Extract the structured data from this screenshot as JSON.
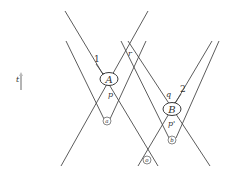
{
  "diagram": {
    "axis": {
      "label": "t",
      "x": 16,
      "y": 82,
      "arrow": {
        "x": 21,
        "y1": 90,
        "y2": 72
      }
    },
    "lines": [
      {
        "id": "worldline-left-outer-down",
        "x1": 65,
        "y1": 11,
        "x2": 158,
        "y2": 166
      },
      {
        "id": "worldline-left-outer-up",
        "x1": 148,
        "y1": 11,
        "x2": 61,
        "y2": 166
      },
      {
        "id": "cone-a-left",
        "x1": 66,
        "y1": 41,
        "x2": 104,
        "y2": 119
      },
      {
        "id": "cone-a-right",
        "x1": 110,
        "y1": 119,
        "x2": 146,
        "y2": 41
      },
      {
        "id": "cone-b-left",
        "x1": 121,
        "y1": 41,
        "x2": 169,
        "y2": 138
      },
      {
        "id": "worldline-right-down",
        "x1": 128,
        "y1": 41,
        "x2": 210,
        "y2": 166
      },
      {
        "id": "worldline-right-up",
        "x1": 212,
        "y1": 41,
        "x2": 138,
        "y2": 166
      },
      {
        "id": "cone-b-right",
        "x1": 176,
        "y1": 138,
        "x2": 219,
        "y2": 41
      }
    ],
    "events": [
      {
        "label": "A",
        "cx": 109,
        "cy": 79,
        "rx": 9,
        "ry": 6.5
      },
      {
        "label": "B",
        "cx": 172,
        "cy": 109,
        "rx": 9,
        "ry": 6.5
      }
    ],
    "vertices": [
      {
        "label": "a",
        "cx": 107,
        "cy": 121,
        "r": 4
      },
      {
        "label": "b",
        "cx": 172,
        "cy": 140,
        "r": 4
      },
      {
        "label": "o",
        "cx": 147,
        "cy": 160,
        "r": 4
      }
    ],
    "labels": [
      {
        "text": "1",
        "x": 94,
        "y": 62,
        "kind": "num"
      },
      {
        "text": "p",
        "x": 108,
        "y": 97,
        "kind": "lbl"
      },
      {
        "text": "q",
        "x": 166,
        "y": 97,
        "kind": "lbl"
      },
      {
        "text": "2",
        "x": 180,
        "y": 92,
        "kind": "num"
      },
      {
        "text": "p'",
        "x": 168,
        "y": 126,
        "kind": "lbl"
      },
      {
        "text": "r",
        "x": 128,
        "y": 56,
        "kind": "lbl"
      }
    ],
    "pointers": [
      {
        "id": "pointer-1",
        "x1": 96,
        "y1": 64,
        "x2": 103,
        "y2": 74
      },
      {
        "id": "pointer-2",
        "x1": 181,
        "y1": 94,
        "x2": 175,
        "y2": 103
      }
    ]
  }
}
